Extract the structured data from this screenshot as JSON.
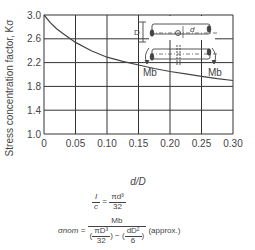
{
  "chart_data": {
    "type": "line",
    "title": "",
    "xlabel": "d/D",
    "ylabel": "Stress concentration factor, Kσ",
    "xlim": [
      0,
      0.3
    ],
    "ylim": [
      1.0,
      3.0
    ],
    "grid": true,
    "x_ticks": [
      "0",
      "0.05",
      "0.10",
      "0.15",
      "0.20",
      "0.25",
      "0.30"
    ],
    "y_ticks": [
      "1.0",
      "1.4",
      "1.8",
      "2.2",
      "2.6",
      "3.0"
    ],
    "series": [
      {
        "name": "Kσ",
        "x": [
          0,
          0.01,
          0.02,
          0.03,
          0.05,
          0.075,
          0.1,
          0.125,
          0.15,
          0.175,
          0.2,
          0.225,
          0.25,
          0.275,
          0.3
        ],
        "y": [
          3.0,
          2.87,
          2.77,
          2.69,
          2.54,
          2.4,
          2.29,
          2.22,
          2.16,
          2.1,
          2.05,
          2.01,
          1.97,
          1.93,
          1.9
        ]
      }
    ],
    "inset_labels": {
      "D": "D",
      "d": "d",
      "moment_left": "Mb",
      "moment_right": "Mb"
    }
  },
  "formulas": {
    "line1_lhs_num": "I",
    "line1_lhs_den": "c",
    "line1_rhs_num": "πd³",
    "line1_rhs_den": "32",
    "line2_lhs": "σnom",
    "line2_num": "Mb",
    "line2_den_a_num": "πD³",
    "line2_den_a_den": "32",
    "line2_den_b_num": "dD²",
    "line2_den_b_den": "6",
    "line2_note": "(approx.)"
  }
}
